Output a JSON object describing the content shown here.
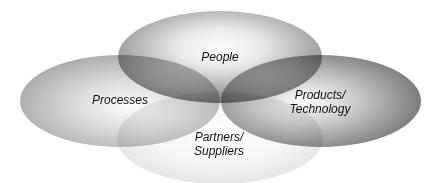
{
  "diagram": {
    "type": "overlapping-ellipses",
    "background": "#ffffff",
    "ellipses": [
      {
        "id": "partners",
        "label_line1": "Partners/",
        "label_line2": "Suppliers",
        "cx": 220,
        "cy": 138,
        "rx": 103,
        "ry": 46,
        "edge_color": "#d8d8d8",
        "center_color": "#ffffff",
        "opacity": 0.55,
        "label_x": 219,
        "label_y": 144
      },
      {
        "id": "processes",
        "label_line1": "Processes",
        "label_line2": "",
        "cx": 120,
        "cy": 101,
        "rx": 100,
        "ry": 46,
        "edge_color": "#8c8c8c",
        "center_color": "#ffffff",
        "opacity": 0.75,
        "label_x": 120,
        "label_y": 100
      },
      {
        "id": "products",
        "label_line1": "Products/",
        "label_line2": "Technology",
        "cx": 321,
        "cy": 101,
        "rx": 100,
        "ry": 46,
        "edge_color": "#5e5e5e",
        "center_color": "#ffffff",
        "opacity": 0.8,
        "label_x": 320,
        "label_y": 102
      },
      {
        "id": "people",
        "label_line1": "People",
        "label_line2": "",
        "cx": 220,
        "cy": 57,
        "rx": 102,
        "ry": 46,
        "edge_color": "#6e6e6e",
        "center_color": "#ffffff",
        "opacity": 0.75,
        "label_x": 220,
        "label_y": 57
      }
    ]
  },
  "labels": {
    "people": "People",
    "processes": "Processes",
    "products_line1": "Products/",
    "products_line2": "Technology",
    "partners_line1": "Partners/",
    "partners_line2": "Suppliers"
  }
}
